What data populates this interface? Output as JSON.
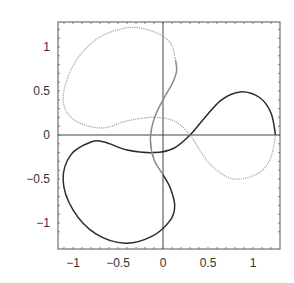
{
  "chart_data": {
    "type": "line",
    "subtype": "parametric",
    "title": "",
    "xlabel": "",
    "ylabel": "",
    "xlim": [
      -1.17,
      1.3
    ],
    "ylim": [
      -1.3,
      1.28
    ],
    "grid": false,
    "legend": null,
    "axes_through_origin": true,
    "x_ticks": [
      -1,
      -0.5,
      0,
      0.5,
      1
    ],
    "y_ticks": [
      -1,
      -0.5,
      0,
      0.5,
      1
    ],
    "x_tick_labels": [
      "−1",
      "−0.5",
      "0",
      "0.5",
      "1"
    ],
    "y_tick_labels": [
      "−1",
      "−0.5",
      "0",
      "0.5",
      "1"
    ],
    "series": [
      {
        "name": "segment-1",
        "color": "#2b2b2b",
        "style": "solid",
        "points": [
          [
            1.25,
            0
          ],
          [
            1.2,
            0.25
          ],
          [
            1.08,
            0.42
          ],
          [
            0.86,
            0.49
          ],
          [
            0.65,
            0.4
          ],
          [
            0.45,
            0.18
          ],
          [
            0.3,
            0
          ],
          [
            0.12,
            -0.15
          ],
          [
            -0.1,
            -0.2
          ],
          [
            -0.4,
            -0.17
          ],
          [
            -0.65,
            -0.08
          ],
          [
            -0.8,
            -0.08
          ],
          [
            -1.02,
            -0.22
          ],
          [
            -1.11,
            -0.51
          ],
          [
            -1.0,
            -0.85
          ],
          [
            -0.75,
            -1.12
          ],
          [
            -0.42,
            -1.23
          ],
          [
            -0.12,
            -1.15
          ],
          [
            0.08,
            -0.97
          ],
          [
            0.13,
            -0.8
          ],
          [
            0.08,
            -0.6
          ],
          [
            0,
            -0.45
          ]
        ]
      },
      {
        "name": "segment-2",
        "color": "#8a8a8a",
        "style": "solid",
        "points": [
          [
            0,
            -0.45
          ],
          [
            -0.1,
            -0.28
          ],
          [
            -0.14,
            -0.05
          ],
          [
            -0.1,
            0.18
          ],
          [
            0,
            0.4
          ],
          [
            0.1,
            0.58
          ],
          [
            0.15,
            0.72
          ],
          [
            0.14,
            0.85
          ]
        ]
      },
      {
        "name": "segment-3",
        "color": "#a8a8a8",
        "style": "dotted",
        "points": [
          [
            0.14,
            0.85
          ],
          [
            0.08,
            1.05
          ],
          [
            -0.12,
            1.18
          ],
          [
            -0.39,
            1.22
          ],
          [
            -0.72,
            1.1
          ],
          [
            -0.98,
            0.82
          ],
          [
            -1.11,
            0.43
          ],
          [
            -1.0,
            0.18
          ],
          [
            -0.69,
            0.08
          ],
          [
            -0.4,
            0.16
          ],
          [
            -0.12,
            0.2
          ],
          [
            0.12,
            0.16
          ],
          [
            0.3,
            0
          ],
          [
            0.48,
            -0.28
          ],
          [
            0.68,
            -0.46
          ],
          [
            0.86,
            -0.5
          ],
          [
            1.08,
            -0.42
          ],
          [
            1.2,
            -0.25
          ],
          [
            1.25,
            0
          ]
        ]
      }
    ]
  },
  "layout": {
    "frame": {
      "left": 58,
      "top": 22,
      "right": 280,
      "bottom": 249
    },
    "origin_px": {
      "x": 163,
      "y": 135
    },
    "scale_px": {
      "x": 90,
      "y": 88
    }
  }
}
